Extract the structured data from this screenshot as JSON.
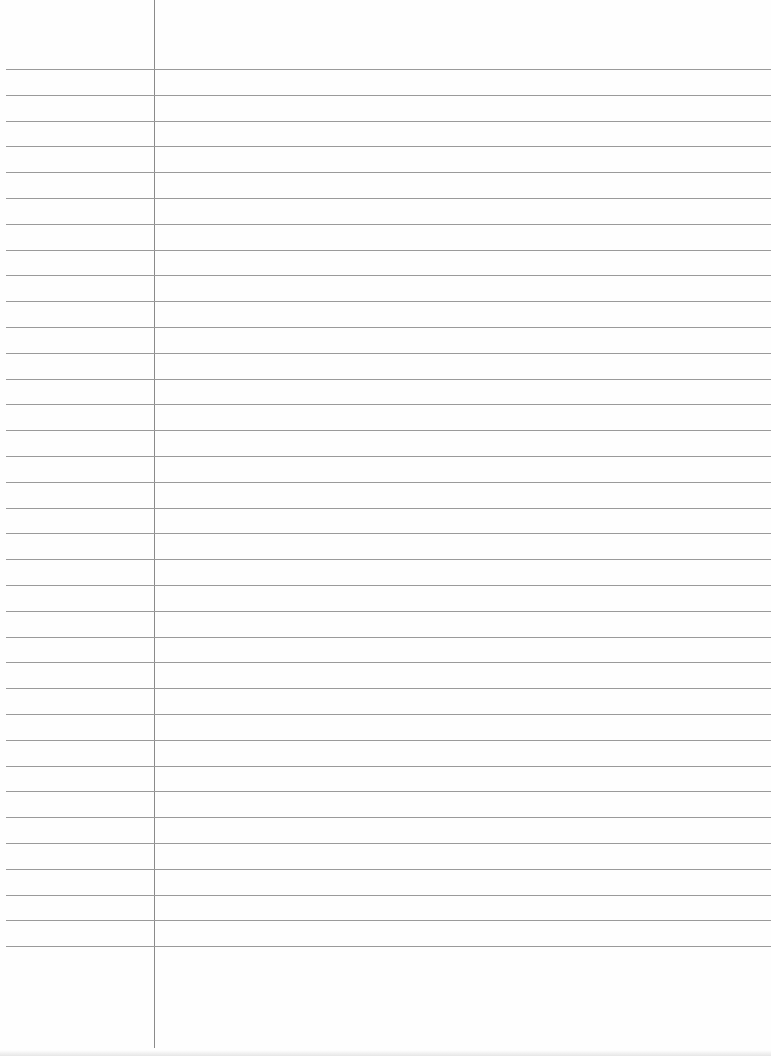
{
  "paper": {
    "type": "lined-notebook-page",
    "background_color": "#fefefe",
    "rule_color": "#9a9a9a",
    "margin_color": "#8a8a8a",
    "margin_x": 154,
    "first_rule_y": 69,
    "rule_spacing": 25.8,
    "rule_count": 35
  }
}
